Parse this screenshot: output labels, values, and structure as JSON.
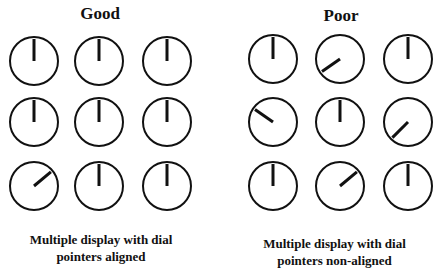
{
  "panels": [
    {
      "title": "Good",
      "caption_line1": "Multiple display with dial",
      "caption_line2": "pointers aligned",
      "columns_x": [
        34,
        99,
        167
      ],
      "rows_y": [
        61,
        122,
        186
      ],
      "pointer_angles_deg": [
        [
          0,
          0,
          0
        ],
        [
          0,
          0,
          0
        ],
        [
          50,
          0,
          0
        ]
      ]
    },
    {
      "title": "Poor",
      "caption_line1": "Multiple display with dial",
      "caption_line2": "pointers non-aligned",
      "columns_x": [
        273,
        340,
        408
      ],
      "rows_y": [
        59,
        122,
        186
      ],
      "pointer_angles_deg": [
        [
          0,
          235,
          0
        ],
        [
          305,
          0,
          225
        ],
        [
          0,
          50,
          0
        ]
      ]
    }
  ],
  "dial": {
    "radius": 24,
    "pointer_length": 22,
    "stroke_color": "#111111"
  }
}
